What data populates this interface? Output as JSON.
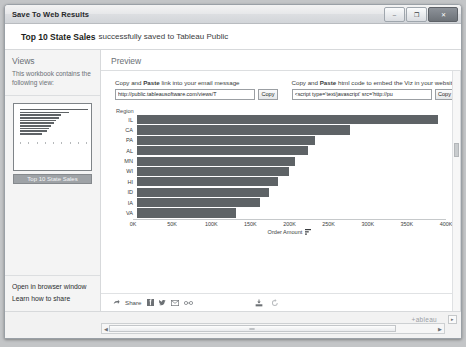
{
  "window": {
    "title": "Save To Web Results",
    "minimize_label": "–",
    "maximize_label": "❐",
    "close_label": "✕"
  },
  "header": {
    "workbook_name": "Top 10 State Sales",
    "message": "successfully saved to Tableau Public"
  },
  "sidebar": {
    "title": "Views",
    "description": "This workbook contains the following view:",
    "thumbnail_caption": "Top 10 State Sales",
    "links": [
      {
        "label": "Open in browser window"
      },
      {
        "label": "Learn how to share"
      }
    ]
  },
  "preview": {
    "title": "Preview",
    "link_block": {
      "label_plain_1": "Copy and ",
      "label_bold": "Paste",
      "label_plain_2": " link into your email message",
      "value": "http://public.tableausoftware.com/views/T",
      "placeholder": "link url",
      "button": "Copy"
    },
    "embed_block": {
      "label_plain_1": "Copy and ",
      "label_bold": "Paste",
      "label_plain_2": " html code to embed the Viz in your website",
      "value": "<script type='text/javascript' src='http://pu",
      "placeholder": "embed code",
      "button": "Copy"
    }
  },
  "share_bar": {
    "share_label": "Share",
    "share_icon": "share-arrow-icon",
    "facebook_icon": "facebook-icon",
    "twitter_icon": "twitter-icon",
    "email_icon": "email-icon",
    "link_icon": "link-icon",
    "download_icon": "download-icon",
    "revert_icon": "revert-icon"
  },
  "footer": {
    "logo_text": "+ableau",
    "scroll_left_arrow": "◀",
    "scroll_right_arrow": "▶",
    "corner_label": "▸"
  },
  "chart_data": {
    "type": "bar",
    "orientation": "horizontal",
    "title": "",
    "row_header": "Region",
    "categories": [
      "IL",
      "CA",
      "PA",
      "AL",
      "MN",
      "WI",
      "HI",
      "ID",
      "IA",
      "VA"
    ],
    "values": [
      390000,
      276000,
      231000,
      222000,
      205000,
      197000,
      182000,
      171000,
      159000,
      128000
    ],
    "xlabel": "Order Amount",
    "ylabel": "Region",
    "xlim": [
      0,
      400000
    ],
    "tick_labels": [
      "0K",
      "50K",
      "100K",
      "150K",
      "200K",
      "250K",
      "300K",
      "350K",
      "400K"
    ],
    "tick_values": [
      0,
      50000,
      100000,
      150000,
      200000,
      250000,
      300000,
      350000,
      400000
    ],
    "bar_color": "#5e6366",
    "grid": false,
    "legend": "none",
    "sort_indicator": "descending"
  }
}
